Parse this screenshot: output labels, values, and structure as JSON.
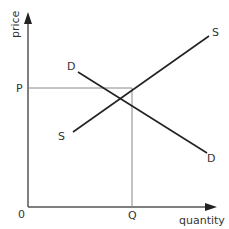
{
  "diagram": {
    "axes": {
      "x_label": "quantity",
      "y_label": "price",
      "origin_label": "0"
    },
    "equilibrium": {
      "price_label": "P",
      "quantity_label": "Q"
    },
    "curves": {
      "demand": {
        "start_label": "D",
        "end_label": "D"
      },
      "supply": {
        "start_label": "S",
        "end_label": "S"
      }
    },
    "colors": {
      "axis": "#555555",
      "curve": "#222222",
      "guide": "#888888",
      "text": "#333333"
    }
  }
}
